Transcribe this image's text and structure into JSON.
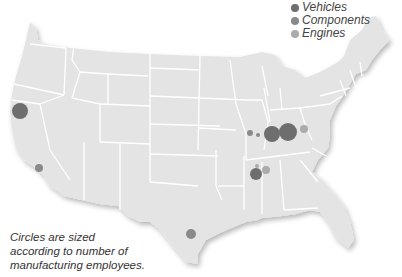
{
  "legend": {
    "items": [
      {
        "label": "Vehicles",
        "color": "#6e6e6e"
      },
      {
        "label": "Components",
        "color": "#8a8a8a"
      },
      {
        "label": "Engines",
        "color": "#ababab"
      }
    ]
  },
  "note": {
    "lines": [
      "Circles are sized",
      "according to number of",
      "manufacturing employees."
    ]
  },
  "colors": {
    "land": "#e4e4e4",
    "border": "#ffffff",
    "shadow": "#cfcfcf"
  },
  "chart_data": {
    "type": "scatter",
    "title": "",
    "legend": [
      "Vehicles",
      "Components",
      "Engines"
    ],
    "points": [
      {
        "region": "Northern California",
        "x": 20,
        "y": 111,
        "r": 8,
        "category": "Vehicles"
      },
      {
        "region": "Southern California",
        "x": 39,
        "y": 168,
        "r": 4,
        "category": "Components"
      },
      {
        "region": "South Texas",
        "x": 191,
        "y": 234,
        "r": 5,
        "category": "Components"
      },
      {
        "region": "Southern Illinois",
        "x": 250,
        "y": 133,
        "r": 3,
        "category": "Components"
      },
      {
        "region": "Southern Illinois",
        "x": 258,
        "y": 135,
        "r": 2,
        "category": "Components"
      },
      {
        "region": "Southern Indiana",
        "x": 272,
        "y": 134,
        "r": 8,
        "category": "Vehicles"
      },
      {
        "region": "Kentucky",
        "x": 288,
        "y": 132,
        "r": 9,
        "category": "Vehicles"
      },
      {
        "region": "Kentucky East",
        "x": 304,
        "y": 129,
        "r": 4,
        "category": "Engines"
      },
      {
        "region": "Tennessee West",
        "x": 257,
        "y": 166,
        "r": 2,
        "category": "Engines"
      },
      {
        "region": "Mississippi",
        "x": 256,
        "y": 174,
        "r": 6,
        "category": "Vehicles"
      },
      {
        "region": "Alabama North",
        "x": 266,
        "y": 170,
        "r": 4,
        "category": "Engines"
      }
    ]
  }
}
